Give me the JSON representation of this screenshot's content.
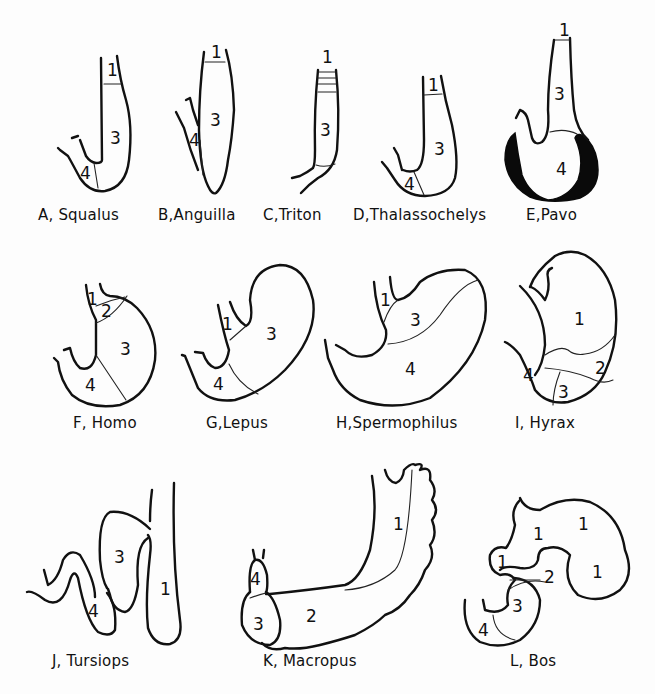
{
  "figure": {
    "panels": [
      {
        "id": "A",
        "caption": "A, Squalus",
        "regions": [
          "1",
          "3",
          "4"
        ]
      },
      {
        "id": "B",
        "caption": "B,Anguilla",
        "regions": [
          "1",
          "3",
          "4"
        ]
      },
      {
        "id": "C",
        "caption": "C,Triton",
        "regions": [
          "1",
          "3"
        ]
      },
      {
        "id": "D",
        "caption": "D,Thalassochelys",
        "regions": [
          "1",
          "3",
          "4"
        ]
      },
      {
        "id": "E",
        "caption": "E,Pavo",
        "regions": [
          "1",
          "3",
          "4"
        ]
      },
      {
        "id": "F",
        "caption": "F, Homo",
        "regions": [
          "1",
          "2",
          "3",
          "4"
        ]
      },
      {
        "id": "G",
        "caption": "G,Lepus",
        "regions": [
          "1",
          "3",
          "4"
        ]
      },
      {
        "id": "H",
        "caption": "H,Spermophilus",
        "regions": [
          "1",
          "3",
          "4"
        ]
      },
      {
        "id": "I",
        "caption": "I, Hyrax",
        "regions": [
          "1",
          "2",
          "3",
          "4"
        ]
      },
      {
        "id": "J",
        "caption": "J, Tursiops",
        "regions": [
          "3",
          "4",
          "1"
        ]
      },
      {
        "id": "K",
        "caption": "K, Macropus",
        "regions": [
          "4",
          "3",
          "2",
          "1"
        ]
      },
      {
        "id": "L",
        "caption": "L, Bos",
        "regions": [
          "1",
          "1",
          "1",
          "1",
          "2",
          "3",
          "4"
        ]
      }
    ]
  }
}
